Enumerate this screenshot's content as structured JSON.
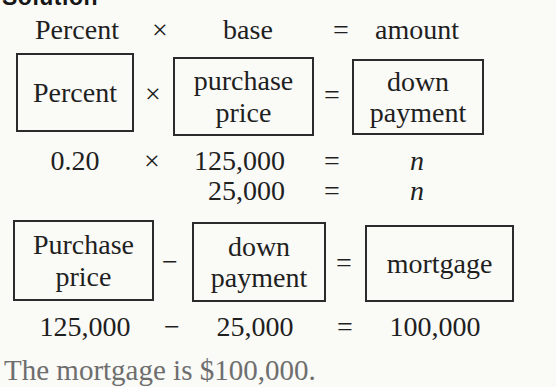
{
  "colors": {
    "background": "#fafaf7",
    "text": "#1f1f1f",
    "box_border": "#2b2b2b",
    "conclusion_text": "#6e6e6e"
  },
  "heading": "Solution",
  "rows": {
    "formula": {
      "operand1": "Percent",
      "operator": "×",
      "operand2": "base",
      "equals": "=",
      "result": "amount"
    },
    "boxes1": {
      "operand1": "Percent",
      "operator": "×",
      "operand2": "purchase price",
      "equals": "=",
      "result": "down payment"
    },
    "calc1": {
      "operand1": "0.20",
      "operator": "×",
      "operand2": "125,000",
      "equals": "=",
      "result": "n"
    },
    "calc2": {
      "operand2": "25,000",
      "equals": "=",
      "result": "n"
    },
    "boxes2": {
      "operand1": "Purchase price",
      "operator": "−",
      "operand2": "down payment",
      "equals": "=",
      "result": "mortgage"
    },
    "calc3": {
      "operand1": "125,000",
      "operator": "−",
      "operand2": "25,000",
      "equals": "=",
      "result": "100,000"
    }
  },
  "conclusion": "The mortgage is $100,000."
}
